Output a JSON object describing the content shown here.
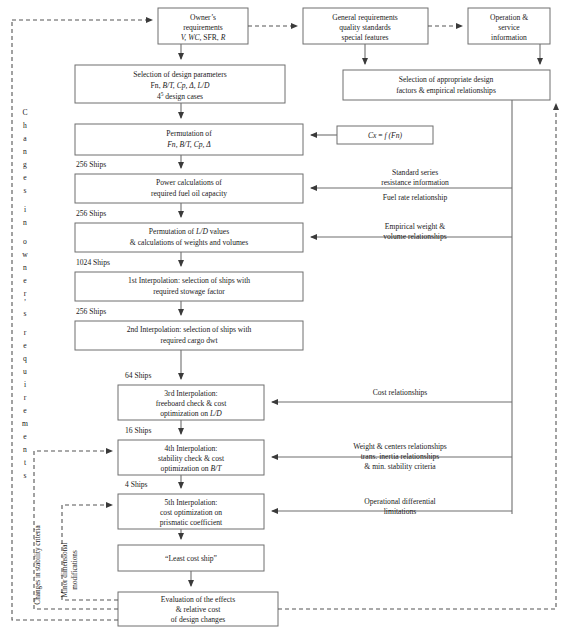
{
  "diagram": {
    "colors": {
      "box_stroke": "#6f6f6f",
      "line": "#6f6f6f",
      "dashed_line": "#555555",
      "text": "#1a1a1a",
      "background": "#ffffff"
    },
    "boxes": {
      "owner_requirements": {
        "line1": "Owner’s",
        "line2": "requirements",
        "line3_italic": "V, WC,",
        "line3_rest": " SFR, ",
        "line3_italic2": "R"
      },
      "general_requirements": {
        "line1": "General requirements",
        "line2": "quality standards",
        "line3": "special features"
      },
      "operation_service": {
        "line1": "Operation &",
        "line2": "service",
        "line3": "information"
      },
      "selection_design_parameters": {
        "line1": "Selection of design parameters",
        "line2_a": "Fn, ",
        "line2_b": "B/T, Cp, Δ, L/D",
        "line3_a": "4",
        "line3_sup": "5",
        "line3_b": " design cases"
      },
      "selection_appropriate_factors": {
        "line1": "Selection of appropriate design",
        "line2": "factors & empirical relationships"
      },
      "permutation_1": {
        "line1": "Permutation of",
        "line2": "Fn, B/T, Cp, Δ"
      },
      "cx_fn": {
        "line1_a": "Cx",
        "line1_b": " = ",
        "line1_c": "f (Fn)"
      },
      "power_calculations": {
        "line1": "Power calculations of",
        "line2": "required fuel oil capacity"
      },
      "permutation_ld": {
        "line1_a": "Permutation of ",
        "line1_b": "L/D",
        "line1_c": " values",
        "line2": "& calculations of weights and volumes"
      },
      "interp_1": {
        "line1": "1st Interpolation:  selection of ships with",
        "line2": "required stowage  factor"
      },
      "interp_2": {
        "line1": "2nd Interpolation: selection of ships with",
        "line2": "required cargo dwt"
      },
      "interp_3": {
        "line1": "3rd Interpolation:",
        "line2": "freeboard check & cost",
        "line3_a": "optimization on ",
        "line3_b": "L/D"
      },
      "interp_4": {
        "line1": "4th  Interpolation:",
        "line2": "stability check & cost",
        "line3_a": "optimization on ",
        "line3_b": "B/T"
      },
      "interp_5": {
        "line1": "5th Interpolation:",
        "line2": "cost optimization on",
        "line3": "prismatic coefficient"
      },
      "least_cost_ship": {
        "line1": "“Least cost ship”"
      },
      "evaluation": {
        "line1": "Evaluation of the effects",
        "line2": "& relative cost",
        "line3": "of design changes"
      }
    },
    "side_labels": {
      "standard_series": {
        "line1": "Standard series",
        "line2": "resistance information",
        "line3": "Fuel rate relationship"
      },
      "empirical_weight": {
        "line1": "Empirical weight &",
        "line2": "volume relationships"
      },
      "cost_relationships": {
        "line1": "Cost relationships"
      },
      "weight_centers": {
        "line1": "Weight & centers relationships",
        "line2": "trans. inertia relationships",
        "line3": "& min. stability criteria"
      },
      "operational_diff": {
        "line1": "Operational differential",
        "line2": "limitations"
      }
    },
    "ship_counts": [
      "256 Ships",
      "256 Ships",
      "1024 Ships",
      "256 Ships",
      "64 Ships",
      "16 Ships",
      "4 Ships"
    ],
    "vertical_labels": {
      "changes_owner_requirements": "Changes in owner's requirements",
      "changes_stability_criteria": "Changes in stability criteria",
      "minor_dimensional_modifications_line1": "Minor dimensional",
      "minor_dimensional_modifications_line2": "modifications"
    }
  }
}
